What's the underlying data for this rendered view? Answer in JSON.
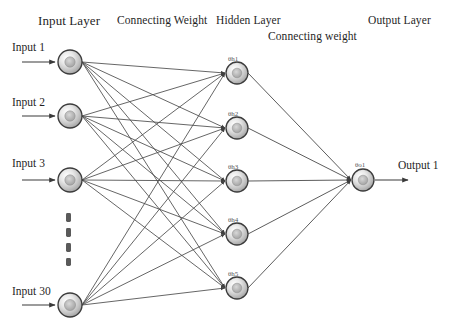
{
  "diagram": {
    "background_color": "#ffffff",
    "edge_color": "#4a4a4a",
    "node_stroke_color": "#3c3c3c",
    "node_fill_light": "#f2f2f2",
    "node_fill_dark": "#9a9a9a",
    "text_color": "#1f1f1f"
  },
  "headers": {
    "input_layer": "Input Layer",
    "connecting_weight_1": "Connecting Weight",
    "hidden_layer": "Hidden Layer",
    "connecting_weight_2": "Connecting weight",
    "output_layer": "Output Layer"
  },
  "input_layer": {
    "labels": {
      "input_1": "Input 1",
      "input_2": "Input 2",
      "input_3": "Input 3",
      "input_30": "Input 30"
    },
    "node_count_visible": 4,
    "total_inputs": 30,
    "ellipsis_dot_count": 4,
    "nodes": [
      {
        "id": "i1",
        "label": "1",
        "cx": 70,
        "cy": 62,
        "r": 12
      },
      {
        "id": "i2",
        "label": "2",
        "cx": 70,
        "cy": 116,
        "r": 12
      },
      {
        "id": "i3",
        "label": "3",
        "cx": 70,
        "cy": 180,
        "r": 12
      },
      {
        "id": "i30",
        "label": "30",
        "cx": 70,
        "cy": 305,
        "r": 12
      }
    ]
  },
  "hidden_layer": {
    "node_count": 5,
    "nodes": [
      {
        "id": "h1",
        "label": "1",
        "theta": "h1",
        "cx": 237,
        "cy": 73,
        "r": 11
      },
      {
        "id": "h2",
        "label": "2",
        "theta": "h2",
        "cx": 237,
        "cy": 128,
        "r": 11
      },
      {
        "id": "h3",
        "label": "3",
        "theta": "h3",
        "cx": 237,
        "cy": 181,
        "r": 11
      },
      {
        "id": "h4",
        "label": "4",
        "theta": "h4",
        "cx": 237,
        "cy": 234,
        "r": 11
      },
      {
        "id": "h5",
        "label": "5",
        "theta": "h5",
        "cx": 237,
        "cy": 288,
        "r": 11
      }
    ],
    "theta_symbol": "θ",
    "theta_labels": [
      "θh1",
      "θh2",
      "θh3",
      "θh4",
      "θh5"
    ]
  },
  "output_layer": {
    "label": "Output 1",
    "node_count": 1,
    "nodes": [
      {
        "id": "o1",
        "label": "o1",
        "theta": "o1",
        "cx": 363,
        "cy": 180,
        "r": 11
      }
    ],
    "theta_label": "θo1"
  },
  "connections": {
    "input_to_hidden_fully_connected": true,
    "hidden_to_output_fully_connected": true,
    "arrowheads": true
  }
}
